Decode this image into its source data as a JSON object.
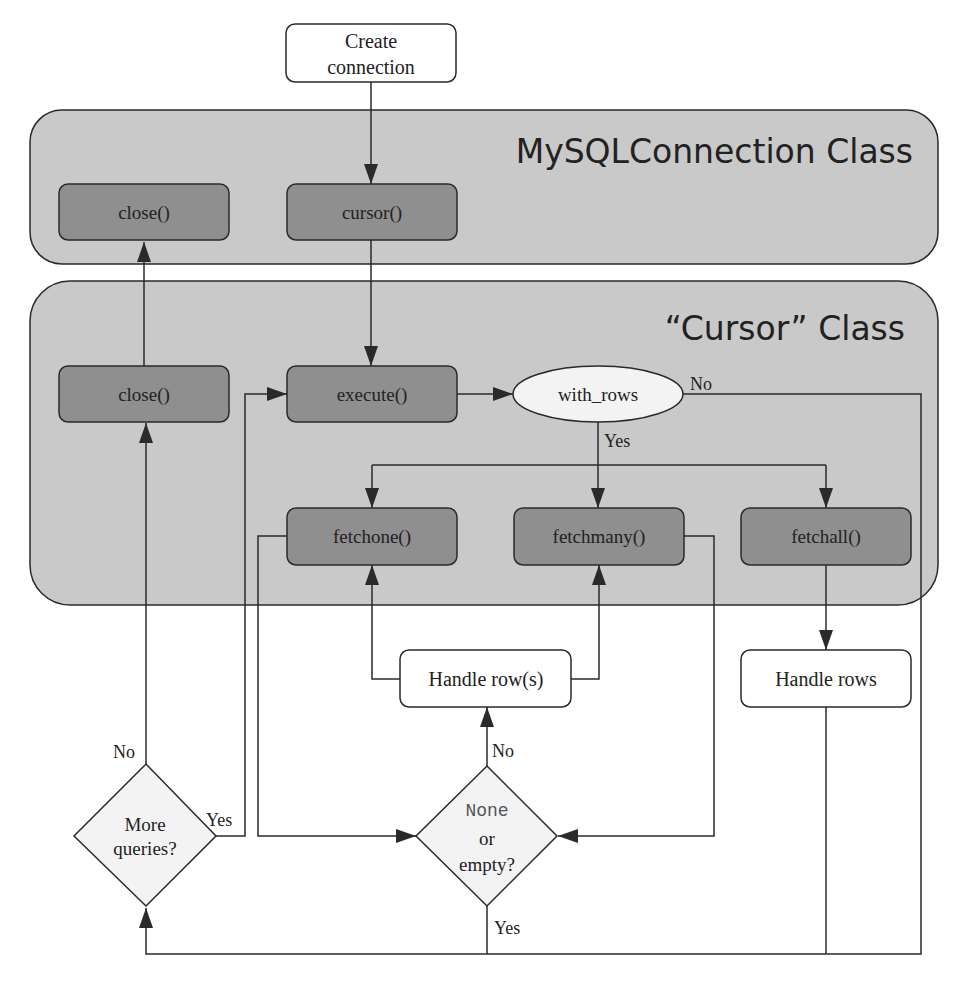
{
  "colors": {
    "background": "#ffffff",
    "class_fill": "#c9c9c9",
    "method_fill": "#8f8f8f",
    "stroke": "#2a2a2a",
    "white_node": "#ffffff",
    "decision_fill": "#f3f3f3",
    "text": "#222222",
    "mono_text": "#555555"
  },
  "containers": {
    "connection_class": {
      "title": "MySQLConnection Class"
    },
    "cursor_class": {
      "title": "“Cursor” Class"
    }
  },
  "nodes": {
    "create_connection": {
      "line1": "Create",
      "line2": "connection"
    },
    "conn_close": {
      "label": "close()"
    },
    "conn_cursor": {
      "label": "cursor()"
    },
    "cursor_close": {
      "label": "close()"
    },
    "execute": {
      "label": "execute()"
    },
    "with_rows": {
      "label": "with_rows"
    },
    "fetchone": {
      "label": "fetchone()"
    },
    "fetchmany": {
      "label": "fetchmany()"
    },
    "fetchall": {
      "label": "fetchall()"
    },
    "handle_row_s": {
      "label": "Handle row(s)"
    },
    "handle_rows": {
      "label": "Handle rows"
    },
    "more_queries": {
      "line1": "More",
      "line2": "queries?"
    },
    "none_or_empty": {
      "line1": "None",
      "line2": "or",
      "line3": "empty?"
    }
  },
  "edge_labels": {
    "with_rows_no": "No",
    "with_rows_yes": "Yes",
    "more_queries_no": "No",
    "more_queries_yes": "Yes",
    "none_empty_no": "No",
    "none_empty_yes": "Yes"
  }
}
